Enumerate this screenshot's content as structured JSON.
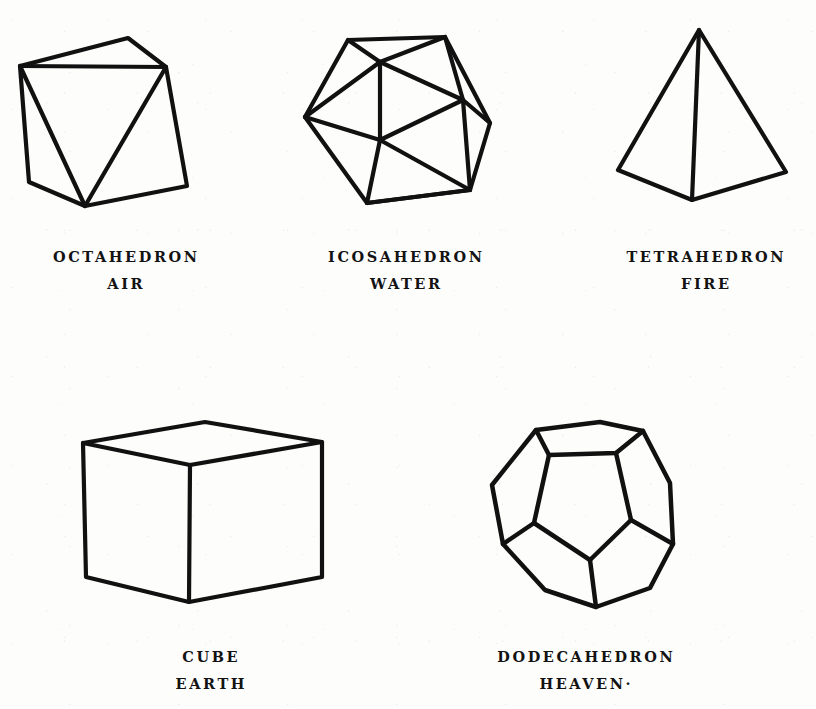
{
  "page": {
    "background_color": "#fdfdfc",
    "ink_color": "#111111",
    "width": 816,
    "height": 709
  },
  "figures": [
    {
      "id": "octahedron",
      "name": "OCTAHEDRON",
      "element": "AIR",
      "row": 1,
      "column": 1,
      "faces": 8,
      "shape": "octahedron"
    },
    {
      "id": "icosahedron",
      "name": "ICOSAHEDRON",
      "element": "WATER",
      "row": 1,
      "column": 2,
      "faces": 20,
      "shape": "icosahedron"
    },
    {
      "id": "tetrahedron",
      "name": "TETRAHEDRON",
      "element": "FIRE",
      "row": 1,
      "column": 3,
      "faces": 4,
      "shape": "tetrahedron"
    },
    {
      "id": "cube",
      "name": "CUBE",
      "element": "EARTH",
      "row": 2,
      "column": 1,
      "faces": 6,
      "shape": "hexahedron"
    },
    {
      "id": "dodecahedron",
      "name": "DODECAHEDRON",
      "element": "HEAVEN·",
      "row": 2,
      "column": 2,
      "faces": 12,
      "shape": "dodecahedron"
    }
  ]
}
